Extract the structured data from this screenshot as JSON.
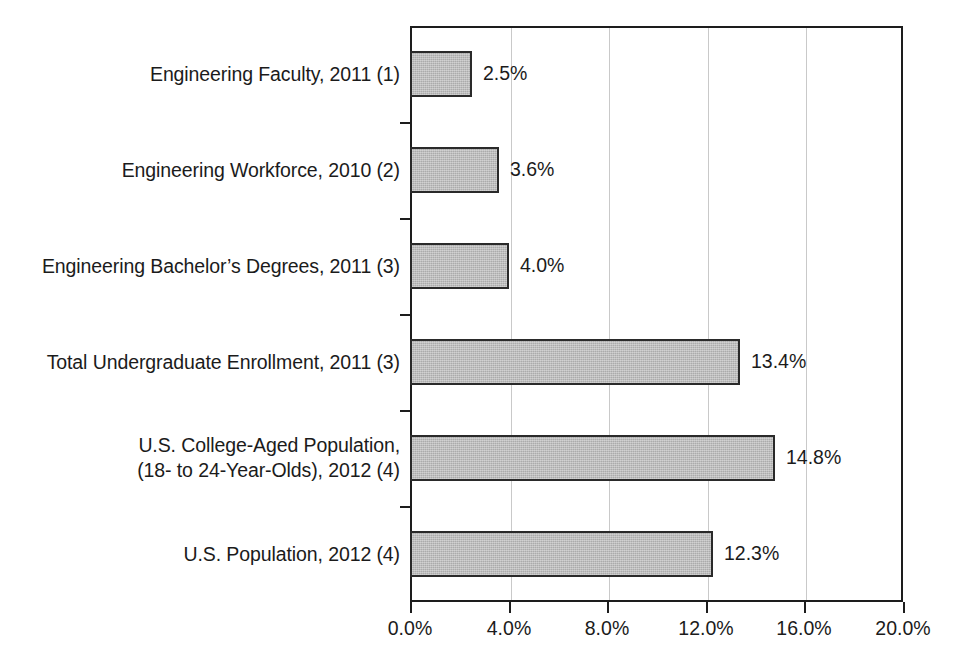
{
  "chart_data": {
    "type": "bar",
    "orientation": "horizontal",
    "title": "",
    "subtitle": "",
    "xlabel": "",
    "ylabel": "",
    "xlim": [
      0,
      20
    ],
    "xtick_step": 4,
    "grid": true,
    "legend": null,
    "unit": "%",
    "categories": [
      "Engineering Faculty, 2011 (1)",
      "Engineering Workforce, 2010 (2)",
      "Engineering Bachelor’s Degrees, 2011 (3)",
      "Total Undergraduate Enrollment, 2011 (3)",
      "U.S. College-Aged Population,\n(18- to 24-Year-Olds), 2012 (4)",
      "U.S. Population, 2012 (4)"
    ],
    "values": [
      2.5,
      3.6,
      4.0,
      13.4,
      14.8,
      12.3
    ],
    "value_labels": [
      "2.5%",
      "3.6%",
      "4.0%",
      "13.4%",
      "14.8%",
      "12.3%"
    ],
    "xtick_labels": [
      "0.0%",
      "4.0%",
      "8.0%",
      "12.0%",
      "16.0%",
      "20.0%"
    ],
    "xtick_values": [
      0,
      4,
      8,
      12,
      16,
      20
    ],
    "colors": {
      "bar_fill": "#ababab",
      "bar_border": "#2a2a2a",
      "axis": "#1d1d1d",
      "gridline": "#c9c9c9",
      "text": "#1b1b1b",
      "background": "#ffffff"
    }
  }
}
